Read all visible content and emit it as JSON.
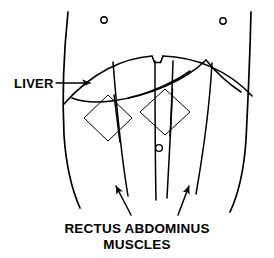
{
  "figure": {
    "title_implied": "Abdominal anatomy — liver and rectus abdominus muscles",
    "background_color": "#ffffff",
    "ink_color": "#000000",
    "width": 274,
    "height": 258
  },
  "labels": {
    "liver": {
      "text": "LIVER",
      "x": 14,
      "y": 88,
      "leader_from_x": 56,
      "leader_to_x": 92,
      "leader_y": 83
    },
    "rectus": {
      "line1": "RECTUS ABDOMINUS",
      "line2": "MUSCLES",
      "line1_x": 137,
      "line1_y": 233,
      "line2_x": 137,
      "line2_y": 249
    }
  },
  "markers": {
    "nipple_left": {
      "name": "nipple-marker-left",
      "cx": 104,
      "cy": 20,
      "r": 3.2
    },
    "nipple_right": {
      "name": "nipple-marker-right",
      "cx": 223,
      "cy": 21,
      "r": 3.2
    },
    "navel": {
      "name": "navel-marker",
      "cx": 159,
      "cy": 148,
      "r": 3.4
    }
  },
  "body_outline": {
    "left_flank_path": "M 68 12 C 64 50, 62 95, 64 135 C 66 165, 72 190, 80 208",
    "right_flank_path": "M 251 12 C 250 55, 248 100, 246 140 C 244 170, 238 195, 230 212"
  },
  "costal_margin": {
    "description": "rib cage lower border arc with central xiphoid notch",
    "left_arc": "M 64 104 C 92 72, 124 58, 152 56",
    "notch": "M 152 56 L 155 62 L 161 62 L 163 56",
    "right_arc": "M 163 56 C 195 57, 228 70, 252 96"
  },
  "liver_organ": {
    "description": "liver lower border sweeping from right upper quadrant down to the left",
    "lower_border": "M 206 60 C 186 80, 150 96, 112 101 C 96 103, 82 102, 72 98",
    "oblique_edge": "M 206 60 C 214 70, 226 82, 241 92"
  },
  "rectus_lines": [
    {
      "name": "rectus-line-1-lateral-left",
      "path": "M 113 62 C 116 100, 120 148, 128 196"
    },
    {
      "name": "rectus-line-2-linea-alba-left",
      "path": "M 155 61 C 155 100, 155 150, 156 200"
    },
    {
      "name": "rectus-line-3-linea-alba-right",
      "path": "M 173 61 C 172 100, 170 150, 167 198"
    },
    {
      "name": "rectus-line-4-lateral-right",
      "path": "M 212 63 C 210 100, 204 148, 196 194"
    }
  ],
  "hatch_patches": [
    {
      "name": "hatch-patch-left",
      "cx": 108,
      "cy": 118,
      "half_w": 24,
      "half_h": 23,
      "rotation": 0
    },
    {
      "name": "hatch-patch-right",
      "cx": 165,
      "cy": 112,
      "half_w": 25,
      "half_h": 23,
      "rotation": 0
    }
  ],
  "pointer_arrows": [
    {
      "name": "arrow-to-left-rectus",
      "tail_x": 131,
      "tail_y": 215,
      "head_x": 115,
      "head_y": 184
    },
    {
      "name": "arrow-to-right-rectus",
      "tail_x": 178,
      "tail_y": 215,
      "head_x": 190,
      "head_y": 184
    }
  ]
}
